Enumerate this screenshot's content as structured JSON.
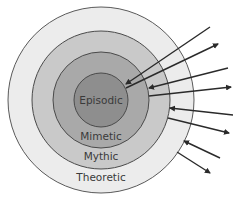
{
  "diagram": {
    "type": "concentric-circles",
    "center": {
      "x": 101,
      "y": 100
    },
    "rings": [
      {
        "label": "Theoretic",
        "radius": 93,
        "fill": "#ececec",
        "stroke": "#5a5a5a",
        "label_y": 181
      },
      {
        "label": "Mythic",
        "radius": 69,
        "fill": "#c9c9c9",
        "stroke": "#4a4a4a",
        "label_y": 160
      },
      {
        "label": "Mimetic",
        "radius": 48,
        "fill": "#a9a9a9",
        "stroke": "#4a4a4a",
        "label_y": 140
      },
      {
        "label": "Episodic",
        "radius": 27,
        "fill": "#8e8e8e",
        "stroke": "#4a4a4a",
        "label_y": 104
      }
    ],
    "arrows": [
      {
        "direction": "inward",
        "x1": 210,
        "y1": 27,
        "x2": 126,
        "y2": 84
      },
      {
        "direction": "outward",
        "x1": 126,
        "y1": 88,
        "x2": 218,
        "y2": 44
      },
      {
        "direction": "inward",
        "x1": 228,
        "y1": 68,
        "x2": 149,
        "y2": 88
      },
      {
        "direction": "outward",
        "x1": 149,
        "y1": 96,
        "x2": 231,
        "y2": 87
      },
      {
        "direction": "inward",
        "x1": 233,
        "y1": 115,
        "x2": 170,
        "y2": 108
      },
      {
        "direction": "outward",
        "x1": 168,
        "y1": 118,
        "x2": 229,
        "y2": 133
      },
      {
        "direction": "inward",
        "x1": 220,
        "y1": 158,
        "x2": 184,
        "y2": 141
      },
      {
        "direction": "outward",
        "x1": 177,
        "y1": 152,
        "x2": 210,
        "y2": 173
      }
    ],
    "arrow_color": "#2a2a2a"
  }
}
